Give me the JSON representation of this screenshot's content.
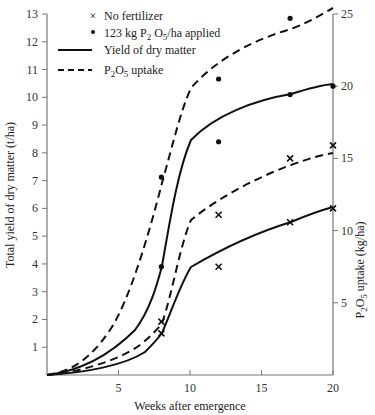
{
  "chart_data": {
    "type": "line",
    "title": "",
    "xlabel": "Weeks after emergence",
    "ylabel": "Total yield of dry matter (t/ha)",
    "ylabel_right": "P2O5 uptake (kg/ha)",
    "xlim": [
      0,
      20
    ],
    "ylim": [
      0,
      13
    ],
    "ylim_right": [
      0,
      25
    ],
    "x_ticks": [
      "5",
      "10",
      "15",
      "20"
    ],
    "y_ticks": [
      "1",
      "2",
      "3",
      "4",
      "5",
      "6",
      "7",
      "8",
      "9",
      "10",
      "11",
      "12",
      "13"
    ],
    "y_ticks_right": [
      "5",
      "10",
      "15",
      "20",
      "25"
    ],
    "grid": false,
    "legend": {
      "position": "top-left",
      "entries": [
        {
          "marker": "×",
          "label": "No fertilizer"
        },
        {
          "marker": "•",
          "label_pre": "123 kg P",
          "sub1": "2",
          "label_mid": " O",
          "sub2": "5",
          "label_post": "/ha applied"
        },
        {
          "line": "solid",
          "label": "Yield of dry matter"
        },
        {
          "line": "dashed",
          "label_pre": "P",
          "sub1": "2",
          "label_mid": "O",
          "sub2": "5",
          "label_post": " uptake"
        }
      ]
    },
    "series": [
      {
        "name": "Yield of dry matter, 123 kg P2O5/ha applied",
        "axis": "left",
        "line": "solid",
        "marker": "dot",
        "x": [
          8,
          12,
          17,
          20
        ],
        "values": [
          3.9,
          8.4,
          10.1,
          10.4
        ]
      },
      {
        "name": "Yield of dry matter, no fertilizer",
        "axis": "left",
        "line": "solid",
        "marker": "cross",
        "x": [
          8,
          12,
          17,
          20
        ],
        "values": [
          1.5,
          3.9,
          5.5,
          6.0
        ]
      },
      {
        "name": "P2O5 uptake, 123 kg P2O5/ha applied",
        "axis": "right",
        "line": "dashed",
        "marker": "dot",
        "x": [
          8,
          12,
          17,
          20
        ],
        "values": [
          13.7,
          20.5,
          24.7,
          26.2
        ]
      },
      {
        "name": "P2O5 uptake, no fertilizer",
        "axis": "right",
        "line": "dashed",
        "marker": "cross",
        "x": [
          8,
          12,
          17,
          20
        ],
        "values": [
          3.7,
          11.1,
          15.0,
          15.9
        ]
      }
    ]
  }
}
